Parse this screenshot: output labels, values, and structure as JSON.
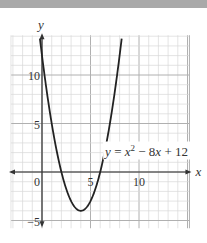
{
  "chart_data": {
    "type": "line",
    "title": "",
    "xlabel": "x",
    "ylabel": "y",
    "xlim": [
      -3.2,
      15.2
    ],
    "ylim": [
      -5.8,
      14.1
    ],
    "grid": true,
    "grid_minor_step": 1,
    "grid_major_step": 5,
    "x_ticks": [
      {
        "value": 0,
        "label": "0"
      },
      {
        "value": 5,
        "label": "5"
      },
      {
        "value": 10,
        "label": "10"
      }
    ],
    "y_ticks": [
      {
        "value": 5,
        "label": "5"
      },
      {
        "value": 10,
        "label": "10"
      },
      {
        "value": -5,
        "label": "−5"
      }
    ],
    "series": [
      {
        "name": "y = x^2 - 8x + 12",
        "equation": "y = x^2 - 8x + 12",
        "vertex": [
          4,
          -4
        ],
        "roots": [
          2,
          6
        ],
        "y_intercept": 12
      }
    ],
    "annotations": [
      {
        "text_base": "y = x",
        "superscript": "2",
        "text_tail": " − 8x + 12",
        "anchor": [
          6.3,
          1.7
        ]
      }
    ]
  },
  "colors": {
    "band": "#a9a9a9",
    "grid_minor": "#d9d9d9",
    "grid_major": "#b0b0b0",
    "axis": "#333333",
    "curve": "#222222"
  }
}
